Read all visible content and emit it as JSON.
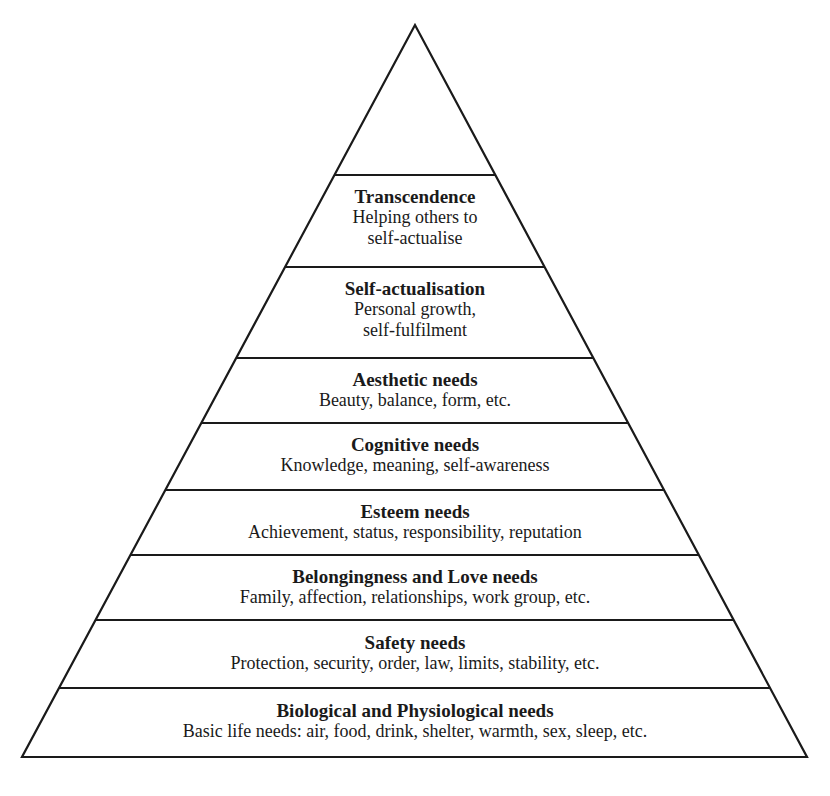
{
  "diagram": {
    "type": "pyramid",
    "levels": [
      {
        "title": "",
        "lines": []
      },
      {
        "title": "Transcendence",
        "lines": [
          "Helping others to",
          "self-actualise"
        ]
      },
      {
        "title": "Self-actualisation",
        "lines": [
          "Personal growth,",
          "self-fulfilment"
        ]
      },
      {
        "title": "Aesthetic needs",
        "lines": [
          "Beauty, balance, form, etc."
        ]
      },
      {
        "title": "Cognitive needs",
        "lines": [
          "Knowledge, meaning, self-awareness"
        ]
      },
      {
        "title": "Esteem needs",
        "lines": [
          "Achievement, status, responsibility, reputation"
        ]
      },
      {
        "title": "Belongingness and Love needs",
        "lines": [
          "Family, affection, relationships, work group, etc."
        ]
      },
      {
        "title": "Safety needs",
        "lines": [
          "Protection, security, order, law, limits, stability, etc."
        ]
      },
      {
        "title": "Biological and Physiological needs",
        "lines": [
          "Basic life needs: air, food, drink, shelter, warmth, sex, sleep, etc."
        ]
      }
    ]
  }
}
